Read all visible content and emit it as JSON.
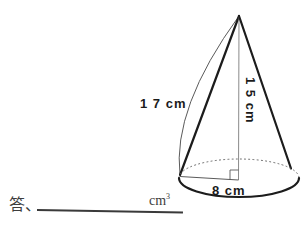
{
  "figure": {
    "type": "cone-volume-problem",
    "labels": {
      "slant": "1 7 cm",
      "height": "1 5 cm",
      "radius": "8 cm"
    },
    "answer": {
      "prefix": "答、",
      "unit_base": "cm",
      "unit_sup": "3"
    },
    "colors": {
      "ink": "#1c1c1c",
      "thin_line": "#555555",
      "background": "#ffffff"
    }
  }
}
